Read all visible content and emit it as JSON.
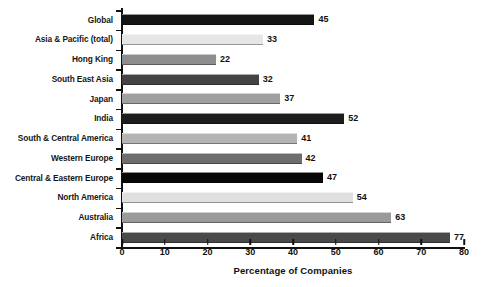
{
  "chart_data": {
    "type": "bar",
    "orientation": "horizontal",
    "title": "",
    "xlabel": "Percentage of Companies",
    "ylabel": "",
    "xlim": [
      0,
      80
    ],
    "xticks": [
      0,
      10,
      20,
      30,
      40,
      50,
      60,
      70,
      80
    ],
    "grid": false,
    "legend": null,
    "categories": [
      "Global",
      "Asia & Pacific (total)",
      "Hong King",
      "South East Asia",
      "Japan",
      "India",
      "South & Central America",
      "Western Europe",
      "Central & Eastern Europe",
      "North America",
      "Australia",
      "Africa"
    ],
    "values": [
      45,
      33,
      22,
      32,
      37,
      52,
      41,
      42,
      47,
      54,
      63,
      77
    ],
    "value_labels": [
      "45",
      "33",
      "22",
      "32",
      "37",
      "52",
      "41",
      "42",
      "47",
      "54",
      "63",
      "77"
    ],
    "bar_colors": [
      "#151515",
      "#e6e6e6",
      "#8d8d8d",
      "#444444",
      "#a0a0a0",
      "#1d1d1d",
      "#b4b4b4",
      "#6e6e6e",
      "#070707",
      "#e0e0e0",
      "#9a9a9a",
      "#4a4a4a"
    ],
    "axis_color": "#111111",
    "text_color": "#161616",
    "background": "#ffffff"
  }
}
